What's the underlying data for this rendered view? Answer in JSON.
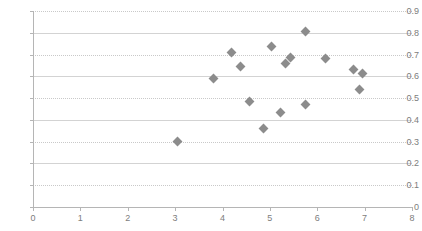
{
  "chart_data": {
    "type": "scatter",
    "title": "",
    "subtitle": "",
    "xlabel": "",
    "ylabel": "",
    "xlim": [
      0,
      8
    ],
    "ylim": [
      0,
      0.9
    ],
    "xticks": [
      0,
      1,
      2,
      3,
      4,
      5,
      6,
      7,
      8
    ],
    "yticks": [
      0,
      0.1,
      0.2,
      0.3,
      0.4,
      0.5,
      0.6,
      0.7,
      0.8,
      0.9
    ],
    "xtick_labels": [
      "0",
      "1",
      "2",
      "3",
      "4",
      "5",
      "6",
      "7",
      "8"
    ],
    "ytick_labels": [
      "0",
      "0.1",
      "0.2",
      "0.3",
      "0.4",
      "0.5",
      "0.6",
      "0.7",
      "0.8",
      "0.9"
    ],
    "grid": "horizontal",
    "legend": "none",
    "legend_entries": [],
    "annotations": [],
    "marker": "diamond",
    "marker_color": "#8c8c8c",
    "gridline_color": "#d3d3d3",
    "axis_color": "#b5b5b5",
    "tick_label_color": "#7d7d7d",
    "series": [
      {
        "name": "",
        "points": [
          {
            "x": 3.06,
            "y": 0.3
          },
          {
            "x": 3.8,
            "y": 0.59
          },
          {
            "x": 4.2,
            "y": 0.71
          },
          {
            "x": 4.39,
            "y": 0.645
          },
          {
            "x": 4.58,
            "y": 0.485
          },
          {
            "x": 5.04,
            "y": 0.735
          },
          {
            "x": 4.87,
            "y": 0.36
          },
          {
            "x": 5.32,
            "y": 0.66
          },
          {
            "x": 5.23,
            "y": 0.435
          },
          {
            "x": 5.44,
            "y": 0.685
          },
          {
            "x": 5.76,
            "y": 0.805
          },
          {
            "x": 5.76,
            "y": 0.47
          },
          {
            "x": 6.18,
            "y": 0.68
          },
          {
            "x": 6.77,
            "y": 0.63
          },
          {
            "x": 6.96,
            "y": 0.615
          },
          {
            "x": 6.9,
            "y": 0.54
          }
        ]
      }
    ]
  }
}
